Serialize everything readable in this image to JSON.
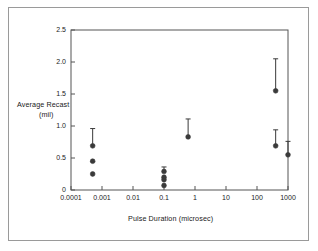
{
  "chart_data": {
    "type": "scatter",
    "title": "",
    "xlabel": "Pulse Duration (microsec)",
    "ylabel_line1": "Average Recast",
    "ylabel_line2": "(mil)",
    "xscale": "log",
    "yscale": "linear",
    "xlim": [
      0.0001,
      1000
    ],
    "ylim": [
      0,
      2.5
    ],
    "xticks": [
      "0.0001",
      "0.001",
      "0.01",
      "0.1",
      "1",
      "10",
      "100",
      "1000"
    ],
    "xtick_values": [
      0.0001,
      0.001,
      0.01,
      0.1,
      1,
      10,
      100,
      1000
    ],
    "yticks": [
      "0",
      "0.5",
      "1.0",
      "1.5",
      "2.0",
      "2.5"
    ],
    "ytick_values": [
      0,
      0.5,
      1.0,
      1.5,
      2.0,
      2.5
    ],
    "grid": false,
    "legend": "none",
    "marker": "filled-circle",
    "marker_color": "#3a3a3a",
    "errorbar_color": "#3a3a3a",
    "points": [
      {
        "x": 0.0005,
        "y": 0.69,
        "yerr_low": 0.69,
        "yerr_high": 0.96
      },
      {
        "x": 0.0005,
        "y": 0.45,
        "yerr_low": 0.45,
        "yerr_high": 0.45
      },
      {
        "x": 0.0005,
        "y": 0.25,
        "yerr_low": 0.25,
        "yerr_high": 0.25
      },
      {
        "x": 0.1,
        "y": 0.29,
        "yerr_low": 0.29,
        "yerr_high": 0.36
      },
      {
        "x": 0.1,
        "y": 0.2,
        "yerr_low": 0.2,
        "yerr_high": 0.2
      },
      {
        "x": 0.1,
        "y": 0.16,
        "yerr_low": 0.16,
        "yerr_high": 0.16
      },
      {
        "x": 0.1,
        "y": 0.07,
        "yerr_low": 0.07,
        "yerr_high": 0.07
      },
      {
        "x": 0.6,
        "y": 0.83,
        "yerr_low": 0.83,
        "yerr_high": 1.11
      },
      {
        "x": 400,
        "y": 1.55,
        "yerr_low": 1.55,
        "yerr_high": 2.05
      },
      {
        "x": 400,
        "y": 0.69,
        "yerr_low": 0.69,
        "yerr_high": 0.94
      },
      {
        "x": 1000,
        "y": 0.55,
        "yerr_low": 0.55,
        "yerr_high": 0.76
      }
    ]
  }
}
